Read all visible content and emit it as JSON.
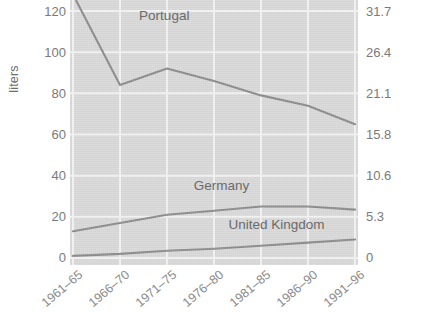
{
  "chart_data": {
    "type": "line",
    "title": "",
    "subtitle": "",
    "xlabel": "",
    "ylabel": "liters",
    "ylabel_right": "",
    "categories": [
      "1961–65",
      "1966–70",
      "1971–75",
      "1976–80",
      "1981–85",
      "1986–90",
      "1991–96"
    ],
    "ylim": [
      0,
      120
    ],
    "yticks": [
      0,
      20,
      40,
      60,
      80,
      100,
      120
    ],
    "ytick_labels": [
      "0",
      "20",
      "40",
      "60",
      "80",
      "100",
      "120"
    ],
    "ylim_right": [
      0,
      31.7
    ],
    "yticks_right": [
      0,
      5.3,
      10.6,
      15.8,
      21.1,
      26.4,
      31.7
    ],
    "ytick_labels_right": [
      "0",
      "5.3",
      "10.6",
      "15.8",
      "21.1",
      "26.4",
      "31.7"
    ],
    "grid": true,
    "legend": "inline-labels",
    "series": [
      {
        "name": "Portugal",
        "color": "#8c8c8c",
        "values": [
          128,
          84,
          92,
          86,
          79,
          74,
          65
        ],
        "label_x_pct": 24,
        "label_y_pct": 3
      },
      {
        "name": "Germany",
        "color": "#8c8c8c",
        "values": [
          13,
          17,
          21,
          23,
          25,
          25,
          23.5
        ],
        "label_x_pct": 43,
        "label_y_pct": 67
      },
      {
        "name": "United Kingdom",
        "color": "#8c8c8c",
        "values": [
          1,
          2,
          3.5,
          4.5,
          6,
          7.5,
          9
        ],
        "label_x_pct": 55,
        "label_y_pct": 82
      }
    ]
  },
  "colors": {
    "plot_background": "#d9d9d9",
    "gridline": "#f2f2f2",
    "line": "#8c8c8c",
    "tick_text": "#7a7a7a",
    "axis_title": "#6d6d6d",
    "page_background": "#ffffff"
  }
}
